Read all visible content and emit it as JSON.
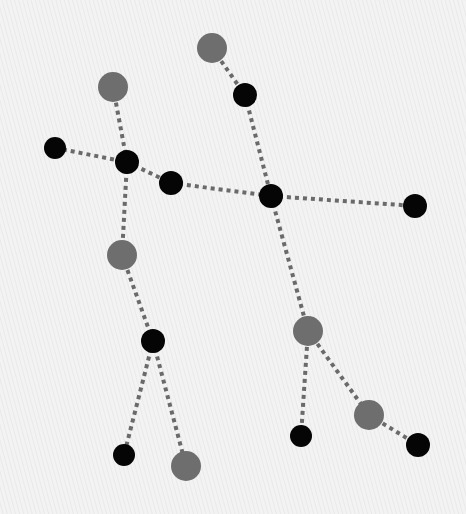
{
  "diagram": {
    "title": "",
    "colors": {
      "background": "#f0f0f0",
      "star_primary": "#050505",
      "star_secondary": "#6e6e6e",
      "edge": "#6a6a6a"
    },
    "nodes": [
      {
        "id": "n1",
        "x": 212,
        "y": 48,
        "r": 15,
        "kind": "secondary"
      },
      {
        "id": "n2",
        "x": 113,
        "y": 87,
        "r": 15,
        "kind": "secondary"
      },
      {
        "id": "n3",
        "x": 245,
        "y": 95,
        "r": 12,
        "kind": "primary"
      },
      {
        "id": "n4",
        "x": 55,
        "y": 148,
        "r": 11,
        "kind": "primary"
      },
      {
        "id": "n5",
        "x": 127,
        "y": 162,
        "r": 12,
        "kind": "primary"
      },
      {
        "id": "n6",
        "x": 171,
        "y": 183,
        "r": 12,
        "kind": "primary"
      },
      {
        "id": "n7",
        "x": 271,
        "y": 196,
        "r": 12,
        "kind": "primary"
      },
      {
        "id": "n8",
        "x": 415,
        "y": 206,
        "r": 12,
        "kind": "primary"
      },
      {
        "id": "n9",
        "x": 122,
        "y": 255,
        "r": 15,
        "kind": "secondary"
      },
      {
        "id": "n10",
        "x": 153,
        "y": 341,
        "r": 12,
        "kind": "primary"
      },
      {
        "id": "n11",
        "x": 308,
        "y": 331,
        "r": 15,
        "kind": "secondary"
      },
      {
        "id": "n12",
        "x": 369,
        "y": 415,
        "r": 15,
        "kind": "secondary"
      },
      {
        "id": "n13",
        "x": 124,
        "y": 455,
        "r": 11,
        "kind": "primary"
      },
      {
        "id": "n14",
        "x": 186,
        "y": 466,
        "r": 15,
        "kind": "secondary"
      },
      {
        "id": "n15",
        "x": 301,
        "y": 436,
        "r": 11,
        "kind": "primary"
      },
      {
        "id": "n16",
        "x": 418,
        "y": 445,
        "r": 12,
        "kind": "primary"
      }
    ],
    "edges": [
      [
        "n1",
        "n3"
      ],
      [
        "n3",
        "n7"
      ],
      [
        "n2",
        "n5"
      ],
      [
        "n4",
        "n5"
      ],
      [
        "n5",
        "n6"
      ],
      [
        "n6",
        "n7"
      ],
      [
        "n7",
        "n8"
      ],
      [
        "n5",
        "n9"
      ],
      [
        "n9",
        "n10"
      ],
      [
        "n10",
        "n13"
      ],
      [
        "n10",
        "n14"
      ],
      [
        "n7",
        "n11"
      ],
      [
        "n11",
        "n15"
      ],
      [
        "n11",
        "n12"
      ],
      [
        "n12",
        "n16"
      ]
    ]
  }
}
